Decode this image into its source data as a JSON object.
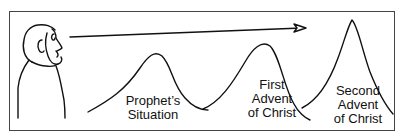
{
  "diagram": {
    "figure": "prophet",
    "arrow": "line-of-sight",
    "peaks": [
      {
        "id": "prophets-situation",
        "lines": [
          "Prophet’s",
          "Situation"
        ]
      },
      {
        "id": "first-advent",
        "lines": [
          "First",
          "Advent",
          "of Christ"
        ]
      },
      {
        "id": "second-advent",
        "lines": [
          "Second",
          "Advent",
          "of Christ"
        ]
      }
    ]
  },
  "colors": {
    "stroke": "#111111",
    "frame": "#444444",
    "background": "#ffffff"
  }
}
